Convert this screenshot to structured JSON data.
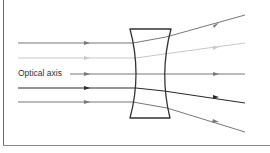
{
  "diagram": {
    "type": "concave-lens-ray-diagram",
    "labels": {
      "optical_axis": "Optical axis"
    },
    "colors": {
      "frame": "#6a6a6a",
      "lens": "#333333",
      "ray_dark": "#2a2a2a",
      "ray_mid": "#777777",
      "ray_light": "#c8c8c8",
      "background": "#ffffff"
    },
    "lens": {
      "top_y": 29,
      "bottom_y": 118,
      "left_x": 130,
      "right_x": 171,
      "waist_left_x": 138,
      "waist_right_x": 163
    },
    "rays": [
      {
        "name": "ray-1",
        "y_in": 43,
        "y_out_end": 15,
        "shade": "mid"
      },
      {
        "name": "ray-2",
        "y_in": 58,
        "y_out_end": 43,
        "shade": "light"
      },
      {
        "name": "optical-axis-ray",
        "y_in": 74,
        "y_out_end": 74,
        "shade": "mid"
      },
      {
        "name": "ray-4",
        "y_in": 88,
        "y_out_end": 103,
        "shade": "dark"
      },
      {
        "name": "ray-5",
        "y_in": 102,
        "y_out_end": 132,
        "shade": "mid"
      }
    ]
  }
}
